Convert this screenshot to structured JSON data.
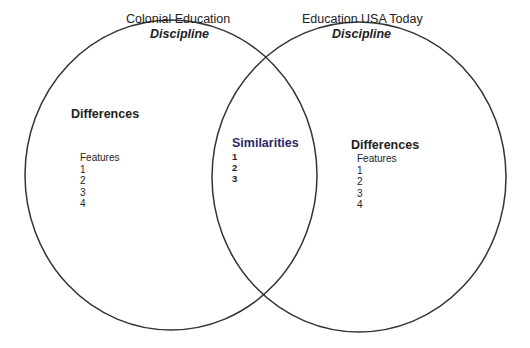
{
  "diagram": {
    "type": "venn",
    "left_circle": {
      "title": "Colonial Education",
      "subtitle": "Discipline",
      "section_heading": "Differences",
      "list_heading": "Features",
      "items": [
        "1",
        "2",
        "3",
        "4"
      ]
    },
    "right_circle": {
      "title": "Education USA Today",
      "subtitle": "Discipline",
      "section_heading": "Differences",
      "list_heading": "Features",
      "items": [
        "1",
        "2",
        "3",
        "4"
      ]
    },
    "overlap": {
      "heading": "Similarities",
      "items": [
        "1",
        "2",
        "3"
      ]
    },
    "colors": {
      "stroke": "#333333",
      "similarities_text": "#2a2a66"
    }
  }
}
